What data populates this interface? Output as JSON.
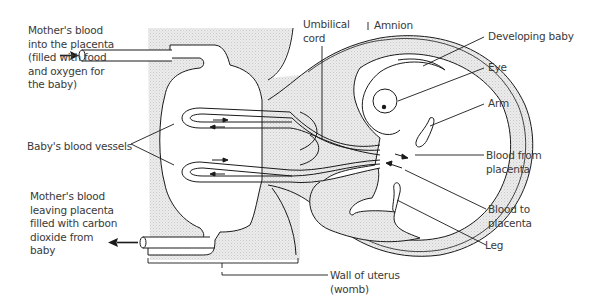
{
  "diagram": {
    "colors": {
      "line": "#1a1a1a",
      "stipple": "#e6e6e6",
      "text": "#3a3a3a",
      "background": "#ffffff"
    },
    "labels": {
      "mother_blood_in": "Mother's blood\ninto the placenta\n(filled with food\nand oxygen for\nthe baby)",
      "baby_vessels": "Baby's blood vessels",
      "mother_blood_out": "Mother's blood\nleaving placenta\nfilled with carbon\ndioxide from\nbaby",
      "umbilical_cord": "Umbilical\ncord",
      "amnion": "Amnion",
      "developing_baby": "Developing baby",
      "eye": "Eye",
      "arm": "Arm",
      "blood_from_placenta": "Blood from\nplacenta",
      "blood_to_placenta": "Blood to\nplacenta",
      "leg": "Leg",
      "wall_of_uterus": "Wall of uterus\n(womb)"
    },
    "icons": {
      "inflow_arrow": "arrow-right-icon",
      "outflow_arrow": "arrow-left-icon"
    }
  }
}
